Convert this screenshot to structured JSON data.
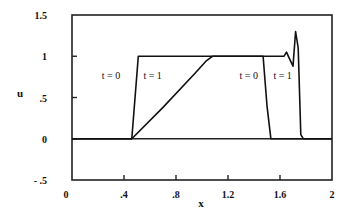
{
  "chart_data": {
    "type": "line",
    "title": "",
    "xlabel": "x",
    "ylabel": "u",
    "xlim": [
      0,
      2
    ],
    "ylim": [
      -0.5,
      1.5
    ],
    "x_ticks": [
      0,
      0.4,
      0.8,
      1.2,
      1.6,
      2
    ],
    "x_tick_labels": [
      "0",
      ".4",
      ".8",
      "1.2",
      "1.6",
      "2"
    ],
    "y_ticks": [
      1.5,
      1,
      0.5,
      0,
      -0.5
    ],
    "y_tick_labels": [
      "1.5",
      "1",
      ".5",
      "0",
      "- .5"
    ],
    "grid": false,
    "legend": null,
    "series": [
      {
        "name": "t = 0",
        "x": [
          0,
          0.46,
          0.51,
          1.47,
          1.5,
          1.53,
          2.0
        ],
        "y": [
          0,
          0,
          1,
          1,
          0.4,
          0,
          0
        ]
      },
      {
        "name": "t = 1",
        "x": [
          0,
          0.46,
          0.7,
          0.95,
          1.03,
          1.08,
          1.6,
          1.63,
          1.65,
          1.67,
          1.7,
          1.72,
          1.74,
          1.76,
          1.78,
          2.0
        ],
        "y": [
          0,
          0,
          0.38,
          0.8,
          0.94,
          1,
          1,
          1.0,
          1.05,
          0.98,
          0.88,
          1.3,
          1.1,
          0.05,
          0,
          0
        ]
      }
    ],
    "annotations": [
      {
        "text": "t = 0",
        "x": 0.3,
        "y": 0.72
      },
      {
        "text": "t = 1",
        "x": 0.62,
        "y": 0.72
      },
      {
        "text": "t = 0",
        "x": 1.36,
        "y": 0.72
      },
      {
        "text": "t = 1",
        "x": 1.62,
        "y": 0.72
      }
    ]
  }
}
